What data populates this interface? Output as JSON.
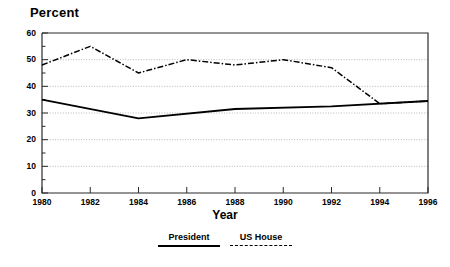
{
  "chart_data": {
    "type": "line",
    "title": "",
    "ylabel": "Percent",
    "xlabel": "Year",
    "x": [
      1980,
      1982,
      1984,
      1986,
      1988,
      1990,
      1992,
      1994,
      1996
    ],
    "categories": [
      "1980",
      "1982",
      "1984",
      "1986",
      "1988",
      "1990",
      "1992",
      "1994",
      "1996"
    ],
    "xlim": [
      1980,
      1996
    ],
    "ylim": [
      0,
      60
    ],
    "yticks": [
      0,
      10,
      20,
      30,
      40,
      50,
      60
    ],
    "ytick_labels": [
      "0",
      "10",
      "20",
      "30",
      "40",
      "50",
      "60"
    ],
    "xticks": [
      1980,
      1982,
      1984,
      1986,
      1988,
      1990,
      1992,
      1994,
      1996
    ],
    "grid": "horizontal-dotted",
    "legend_position": "bottom-center",
    "series": [
      {
        "name": "President",
        "style": "solid",
        "color": "#000000",
        "x": [
          1980,
          1984,
          1988,
          1992,
          1996
        ],
        "values": [
          35.0,
          28.0,
          31.5,
          32.5,
          34.5
        ]
      },
      {
        "name": "US House",
        "style": "dashed",
        "color": "#000000",
        "x": [
          1980,
          1982,
          1984,
          1986,
          1988,
          1990,
          1992,
          1994,
          1996
        ],
        "values": [
          48.0,
          55.0,
          45.0,
          50.0,
          48.0,
          50.0,
          47.0,
          33.5,
          34.5
        ]
      }
    ]
  },
  "legend": {
    "items": [
      {
        "label": "President",
        "style": "solid"
      },
      {
        "label": "US House",
        "style": "dashed"
      }
    ]
  }
}
